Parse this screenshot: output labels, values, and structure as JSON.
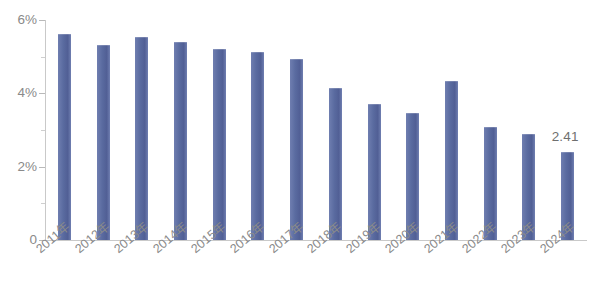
{
  "chart_data": {
    "type": "bar",
    "title": "",
    "subtitle": "",
    "xlabel": "",
    "ylabel": "",
    "categories": [
      "2011年",
      "2012年",
      "2013年",
      "2014年",
      "2015年",
      "2016年",
      "2017年",
      "2018年",
      "2019年",
      "2020年",
      "2021年",
      "2022年",
      "2023年",
      "2024年"
    ],
    "values": [
      5.62,
      5.32,
      5.55,
      5.4,
      5.22,
      5.12,
      4.93,
      4.15,
      3.7,
      3.47,
      4.35,
      3.08,
      2.89,
      2.41
    ],
    "ylim": [
      0,
      6
    ],
    "y_tick_values": [
      0,
      2,
      4,
      6
    ],
    "y_tick_labels": [
      "0",
      "2%",
      "4%",
      "6%"
    ],
    "y_minor_tick_values": [
      1,
      3,
      5
    ],
    "grid": false,
    "legend": null,
    "data_labels": [
      {
        "category": "2024年",
        "text": "2.41"
      }
    ],
    "series": [
      {
        "name": "",
        "color": "#5a6ba0",
        "values": [
          5.62,
          5.32,
          5.55,
          5.4,
          5.22,
          5.12,
          4.93,
          4.15,
          3.7,
          3.47,
          4.35,
          3.08,
          2.89,
          2.41
        ]
      }
    ]
  },
  "style": {
    "bar_color": "#5a6ba0",
    "axis_color": "#c9c9c9",
    "tick_label_color": "#8a8a8a",
    "value_label_color": "#6f6f6f",
    "background": "#ffffff"
  }
}
